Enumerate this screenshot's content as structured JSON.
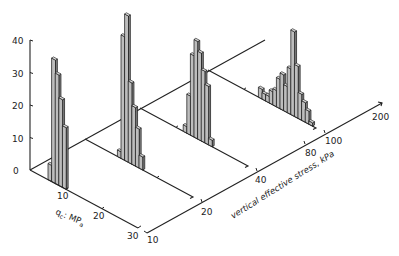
{
  "chart_data": {
    "type": "bar",
    "subtype": "3d-histogram-series",
    "title": "",
    "z_axis": {
      "label": "",
      "ticks": [
        "0",
        "10",
        "20",
        "30",
        "40"
      ],
      "range": [
        0,
        40
      ]
    },
    "x_axis": {
      "label": "qc: MPa",
      "label_main": "q",
      "label_sub": "c",
      "label_rest": ": MP",
      "label_sub2": "a",
      "ticks": [
        "10",
        "20",
        "30"
      ],
      "range": [
        0,
        30
      ]
    },
    "y_axis": {
      "label": "vertical effective stress, kPa",
      "ticks": [
        "10",
        "20",
        "40",
        "80",
        "100",
        "200"
      ]
    },
    "series": [
      {
        "name": "stress 10 kPa",
        "stress": 10,
        "qc_bins": [
          5.5,
          6.5,
          7.5,
          8.5,
          9.5
        ],
        "values": [
          5,
          38,
          34,
          27,
          19
        ]
      },
      {
        "name": "stress 20 kPa",
        "stress": 20,
        "qc_bins": [
          9.5,
          10.5,
          11.5,
          12.5,
          13.5,
          14.5,
          15.5
        ],
        "values": [
          2,
          38,
          45,
          25,
          18,
          12,
          4
        ]
      },
      {
        "name": "stress 40 kPa",
        "stress": 40,
        "qc_bins": [
          12.5,
          13.5,
          14.5,
          15.5,
          16.5,
          17.5,
          18.5,
          19.5
        ],
        "values": [
          2,
          12,
          25,
          30,
          27,
          22,
          18,
          2
        ]
      },
      {
        "name": "stress 100 kPa",
        "stress": 100,
        "qc_bins": [
          14.5,
          15.5,
          16.5,
          17.5,
          18.5,
          19.5,
          20.5,
          21.5,
          22.5,
          23.5,
          24.5,
          25.5,
          26.5,
          27.5,
          28.5
        ],
        "values": [
          3,
          2,
          2,
          4,
          5,
          9,
          11,
          8,
          14,
          26,
          16,
          8,
          6,
          4,
          1
        ]
      }
    ]
  },
  "labels": {
    "z_ticks": [
      "0",
      "10",
      "20",
      "30",
      "40"
    ],
    "qc_ticks": [
      "10",
      "20",
      "30"
    ],
    "stress_ticks": [
      "10",
      "20",
      "40",
      "80",
      "100",
      "200"
    ],
    "qc_label": "qc: MPa",
    "stress_label": "vertical effective stress, kPa"
  }
}
